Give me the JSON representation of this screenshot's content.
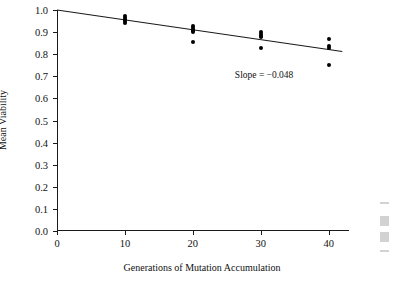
{
  "chart_data": {
    "type": "scatter",
    "title": "",
    "xlabel": "Generations of Mutation Accumulation",
    "ylabel": "Mean Viability",
    "xlim": [
      0,
      43
    ],
    "ylim": [
      0.0,
      1.0
    ],
    "grid": false,
    "legend": "none",
    "xticks": [
      0,
      10,
      20,
      30,
      40
    ],
    "xtick_labels": [
      "0",
      "10",
      "20",
      "30",
      "40"
    ],
    "yticks": [
      0.0,
      0.1,
      0.2,
      0.3,
      0.4,
      0.5,
      0.6,
      0.7,
      0.8,
      0.9,
      1.0
    ],
    "ytick_labels": [
      "0.0",
      "0.1",
      "0.2",
      "0.3",
      "0.4",
      "0.5",
      "0.6",
      "0.7",
      "0.8",
      "0.9",
      "1.0"
    ],
    "series": [
      {
        "name": "Mean viability observations",
        "marker": "filled-circle",
        "color": "#000000",
        "points": [
          {
            "x": 10,
            "y": 0.972
          },
          {
            "x": 10,
            "y": 0.963
          },
          {
            "x": 10,
            "y": 0.956
          },
          {
            "x": 10,
            "y": 0.949
          },
          {
            "x": 10,
            "y": 0.942
          },
          {
            "x": 20,
            "y": 0.928
          },
          {
            "x": 20,
            "y": 0.919
          },
          {
            "x": 20,
            "y": 0.911
          },
          {
            "x": 20,
            "y": 0.903
          },
          {
            "x": 20,
            "y": 0.856
          },
          {
            "x": 30,
            "y": 0.899
          },
          {
            "x": 30,
            "y": 0.891
          },
          {
            "x": 30,
            "y": 0.883
          },
          {
            "x": 30,
            "y": 0.876
          },
          {
            "x": 30,
            "y": 0.829
          },
          {
            "x": 40,
            "y": 0.868
          },
          {
            "x": 40,
            "y": 0.836
          },
          {
            "x": 40,
            "y": 0.829
          },
          {
            "x": 40,
            "y": 0.75
          }
        ]
      }
    ],
    "fit_line": {
      "name": "Least-squares regression",
      "slope_per_generation": -0.0048,
      "slope_label_value": -0.048,
      "intercept": 1.0,
      "x_start": 0,
      "y_start": 1.0,
      "x_end": 42,
      "y_end": 0.812,
      "color": "#1a1a1a"
    },
    "annotations": [
      {
        "name": "slope-annotation",
        "text": "Slope = −0.048",
        "x": 30.5,
        "y": 0.705
      }
    ]
  }
}
